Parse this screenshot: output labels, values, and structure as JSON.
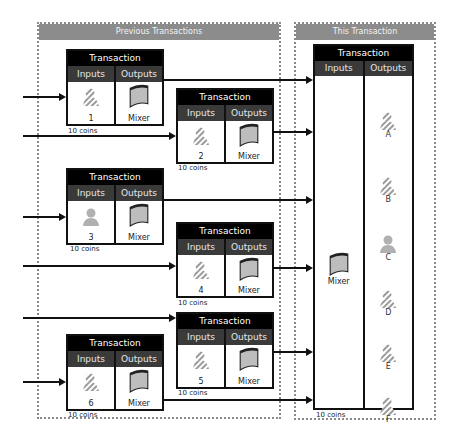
{
  "panels": {
    "previous": {
      "title": "Previous Transactions"
    },
    "current": {
      "title": "This Transaction"
    }
  },
  "labels": {
    "transaction": "Transaction",
    "inputs": "Inputs",
    "outputs": "Outputs",
    "mixer": "Mixer",
    "coins": "10 coins"
  },
  "previous_transactions": [
    {
      "id": "1",
      "input_icon": "hatched-person-icon",
      "output": "Mixer",
      "coins": "10 coins"
    },
    {
      "id": "2",
      "input_icon": "hatched-person-icon",
      "output": "Mixer",
      "coins": "10 coins"
    },
    {
      "id": "3",
      "input_icon": "person-icon",
      "output": "Mixer",
      "coins": "10 coins"
    },
    {
      "id": "4",
      "input_icon": "hatched-person-icon",
      "output": "Mixer",
      "coins": "10 coins"
    },
    {
      "id": "5",
      "input_icon": "hatched-person-icon",
      "output": "Mixer",
      "coins": "10 coins"
    },
    {
      "id": "6",
      "input_icon": "hatched-person-icon",
      "output": "Mixer",
      "coins": "10 coins"
    }
  ],
  "this_transaction": {
    "input": "Mixer",
    "outputs": [
      {
        "id": "A",
        "icon": "hatched-person-icon"
      },
      {
        "id": "B",
        "icon": "hatched-person-icon"
      },
      {
        "id": "C",
        "icon": "person-icon"
      },
      {
        "id": "D",
        "icon": "hatched-person-icon"
      },
      {
        "id": "E",
        "icon": "hatched-person-icon"
      },
      {
        "id": "F",
        "icon": "hatched-person-icon"
      }
    ],
    "coins": "10 coins"
  },
  "colors": {
    "panel_header": "#8c8c8c",
    "tx_title": "#000000",
    "tx_sub": "#3a3a3a",
    "icon_gray": "#a8a8a8"
  }
}
